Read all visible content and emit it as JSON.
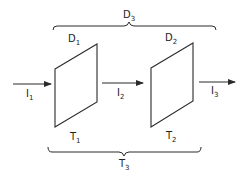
{
  "diagram": {
    "colors": {
      "stroke": "#2a2a2a",
      "background": "#ffffff"
    },
    "elements": [
      {
        "id": "D1",
        "base": "D",
        "sub": "1",
        "role": "element-1-top-label"
      },
      {
        "id": "D2",
        "base": "D",
        "sub": "2",
        "role": "element-2-top-label"
      },
      {
        "id": "D3",
        "base": "D",
        "sub": "3",
        "role": "combined-top-label"
      },
      {
        "id": "T1",
        "base": "T",
        "sub": "1",
        "role": "element-1-bottom-label"
      },
      {
        "id": "T2",
        "base": "T",
        "sub": "2",
        "role": "element-2-bottom-label"
      },
      {
        "id": "T3",
        "base": "T",
        "sub": "3",
        "role": "combined-bottom-label"
      }
    ],
    "arrows": [
      {
        "id": "I1",
        "base": "I",
        "sub": "1"
      },
      {
        "id": "I2",
        "base": "I",
        "sub": "2"
      },
      {
        "id": "I3",
        "base": "I",
        "sub": "3"
      }
    ]
  },
  "labels": {
    "D1": {
      "base": "D",
      "sub": "1"
    },
    "D2": {
      "base": "D",
      "sub": "2"
    },
    "D3": {
      "base": "D",
      "sub": "3"
    },
    "T1": {
      "base": "T",
      "sub": "1"
    },
    "T2": {
      "base": "T",
      "sub": "2"
    },
    "T3": {
      "base": "T",
      "sub": "3"
    },
    "I1": {
      "base": "I",
      "sub": "1"
    },
    "I2": {
      "base": "I",
      "sub": "2"
    },
    "I3": {
      "base": "I",
      "sub": "3"
    }
  }
}
